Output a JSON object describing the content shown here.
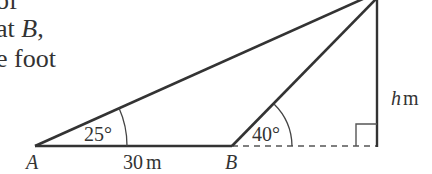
{
  "text_fragment": {
    "line1": "of",
    "line2_prefix": "at ",
    "line2_var": "B",
    "line2_suffix": ",",
    "line3": "e foot"
  },
  "diagram": {
    "points": {
      "A": {
        "label": "A",
        "x": 35,
        "y": 146
      },
      "B": {
        "label": "B",
        "x": 232,
        "y": 146
      },
      "foot": {
        "x": 377,
        "y": 146
      },
      "top": {
        "x": 377,
        "y": 0
      }
    },
    "angles": {
      "at_A": "25°",
      "at_B": "40°"
    },
    "lengths": {
      "AB_value": "30",
      "AB_unit": "m",
      "height_var": "h",
      "height_unit": "m"
    },
    "colors": {
      "line": "#333333",
      "dashed": "#555555"
    }
  }
}
